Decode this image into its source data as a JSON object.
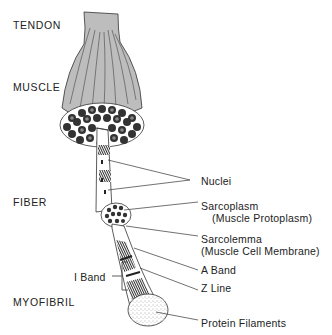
{
  "diagram": {
    "levels": [
      {
        "id": "tendon",
        "label": "TENDON"
      },
      {
        "id": "muscle",
        "label": "MUSCLE"
      },
      {
        "id": "fiber",
        "label": "FIBER"
      },
      {
        "id": "myofibril",
        "label": "MYOFIBRIL"
      }
    ],
    "callouts": {
      "nuclei": {
        "label": "Nuclei"
      },
      "sarcoplasm": {
        "label": "Sarcoplasm",
        "sub": "(Muscle Protoplasm)"
      },
      "sarcolemma": {
        "label": "Sarcolemma",
        "sub": "(Muscle Cell Membrane)"
      },
      "a_band": {
        "label": "A Band"
      },
      "z_line": {
        "label": "Z Line"
      },
      "i_band": {
        "label": "I Band"
      },
      "protein_filaments": {
        "label": "Protein Filaments"
      }
    },
    "colors": {
      "ink": "#222222",
      "muscle_fill": "#bdbdbd",
      "background": "#ffffff"
    }
  }
}
